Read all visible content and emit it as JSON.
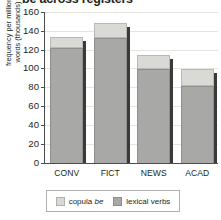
{
  "chart_data": {
    "type": "bar",
    "subtype": "stacked-bar",
    "title": "be across registers",
    "xlabel": "",
    "ylabel": "frequency per million words (thousands)",
    "ylabel_lines": [
      "frequency per million",
      "words (thousands)"
    ],
    "categories": [
      "CONV",
      "FICT",
      "NEWS",
      "ACAD"
    ],
    "series": [
      {
        "name": "lexical verbs",
        "values": [
          122,
          132,
          99,
          81
        ],
        "color": "#a8a8a6"
      },
      {
        "name": "copula be",
        "values": [
          11,
          16,
          15,
          18
        ],
        "color": "#d9d9d6"
      }
    ],
    "totals": [
      133,
      148,
      114,
      99
    ],
    "ylim": [
      0,
      160
    ],
    "yticks": [
      0,
      20,
      40,
      60,
      80,
      100,
      120,
      140,
      160
    ],
    "ytick_labels": [
      "0",
      "20",
      "40",
      "60",
      "80",
      "100",
      "120",
      "140",
      "160"
    ],
    "grid": true,
    "grid_axis": "y",
    "legend": {
      "position": "bottom",
      "entries": [
        {
          "label_plain": "copula ",
          "label_italic": "be",
          "swatch": "copula-swatch"
        },
        {
          "label_plain": "lexical verbs",
          "label_italic": "",
          "swatch": "lexical-swatch"
        }
      ]
    }
  },
  "colors": {
    "lexical_verbs": "#a8a8a6",
    "copula_be": "#d9d9d6",
    "axis": "#4d4d4d",
    "gridline": "#e6e4e0",
    "bar_shadow": "#3a3a3a",
    "text": "#231f20",
    "background": "#ffffff"
  }
}
